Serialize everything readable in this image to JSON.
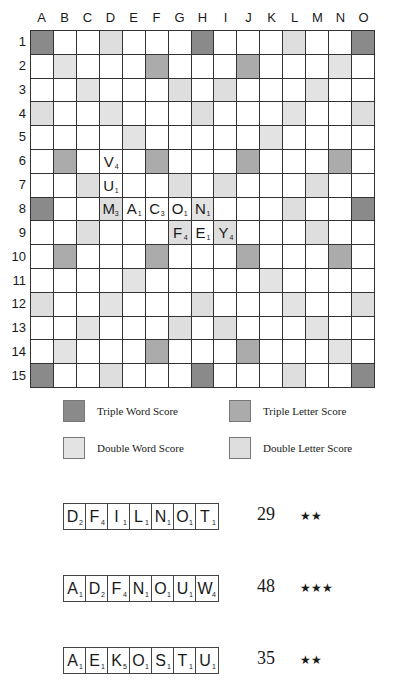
{
  "board": {
    "columns": [
      "A",
      "B",
      "C",
      "D",
      "E",
      "F",
      "G",
      "H",
      "I",
      "J",
      "K",
      "L",
      "M",
      "N",
      "O"
    ],
    "rows": [
      "1",
      "2",
      "3",
      "4",
      "5",
      "6",
      "7",
      "8",
      "9",
      "10",
      "11",
      "12",
      "13",
      "14",
      "15"
    ],
    "premium_layout": [
      "TW..DL...TW...DL..TW",
      "x"
    ],
    "premium_rows": [
      [
        "TW",
        "",
        "",
        "DL",
        "",
        "",
        "",
        "TW",
        "",
        "",
        "",
        "DL",
        "",
        "",
        "TW"
      ],
      [
        "",
        "DW",
        "",
        "",
        "",
        "TL",
        "",
        "",
        "",
        "TL",
        "",
        "",
        "",
        "DW",
        ""
      ],
      [
        "",
        "",
        "DW",
        "",
        "",
        "",
        "DL",
        "",
        "DL",
        "",
        "",
        "",
        "DW",
        "",
        ""
      ],
      [
        "DL",
        "",
        "",
        "DW",
        "",
        "",
        "",
        "DL",
        "",
        "",
        "",
        "DW",
        "",
        "",
        "DL"
      ],
      [
        "",
        "",
        "",
        "",
        "DW",
        "",
        "",
        "",
        "",
        "",
        "DW",
        "",
        "",
        "",
        ""
      ],
      [
        "",
        "TL",
        "",
        "",
        "",
        "TL",
        "",
        "",
        "",
        "TL",
        "",
        "",
        "",
        "TL",
        ""
      ],
      [
        "",
        "",
        "DL",
        "",
        "",
        "",
        "DL",
        "",
        "DL",
        "",
        "",
        "",
        "DL",
        "",
        ""
      ],
      [
        "TW",
        "",
        "",
        "DL",
        "",
        "",
        "",
        "DW",
        "",
        "",
        "",
        "DL",
        "",
        "",
        "TW"
      ],
      [
        "",
        "",
        "DL",
        "",
        "",
        "",
        "DL",
        "",
        "DL",
        "",
        "",
        "",
        "DL",
        "",
        ""
      ],
      [
        "",
        "TL",
        "",
        "",
        "",
        "TL",
        "",
        "",
        "",
        "TL",
        "",
        "",
        "",
        "TL",
        ""
      ],
      [
        "",
        "",
        "",
        "",
        "DW",
        "",
        "",
        "",
        "",
        "",
        "DW",
        "",
        "",
        "",
        ""
      ],
      [
        "DL",
        "",
        "",
        "DW",
        "",
        "",
        "",
        "DL",
        "",
        "",
        "",
        "DW",
        "",
        "",
        "DL"
      ],
      [
        "",
        "",
        "DW",
        "",
        "",
        "",
        "DL",
        "",
        "DL",
        "",
        "",
        "",
        "DW",
        "",
        ""
      ],
      [
        "",
        "DW",
        "",
        "",
        "",
        "TL",
        "",
        "",
        "",
        "TL",
        "",
        "",
        "",
        "DW",
        ""
      ],
      [
        "TW",
        "",
        "",
        "DL",
        "",
        "",
        "",
        "TW",
        "",
        "",
        "",
        "DL",
        "",
        "",
        "TW"
      ]
    ],
    "placed_tiles": [
      {
        "col": "D",
        "row": 6,
        "letter": "V",
        "score": "4"
      },
      {
        "col": "D",
        "row": 7,
        "letter": "U",
        "score": "1"
      },
      {
        "col": "D",
        "row": 8,
        "letter": "M",
        "score": "3"
      },
      {
        "col": "E",
        "row": 8,
        "letter": "A",
        "score": "1"
      },
      {
        "col": "F",
        "row": 8,
        "letter": "C",
        "score": "3"
      },
      {
        "col": "G",
        "row": 8,
        "letter": "O",
        "score": "1"
      },
      {
        "col": "H",
        "row": 8,
        "letter": "N",
        "score": "1"
      },
      {
        "col": "G",
        "row": 9,
        "letter": "F",
        "score": "4"
      },
      {
        "col": "H",
        "row": 9,
        "letter": "E",
        "score": "1"
      },
      {
        "col": "I",
        "row": 9,
        "letter": "Y",
        "score": "4"
      }
    ]
  },
  "legend": {
    "triple_word": "Triple Word Score",
    "triple_letter": "Triple Letter Score",
    "double_word": "Double Word Score",
    "double_letter": "Double Letter Score"
  },
  "colors": {
    "TW": "#8a8a8a",
    "TL": "#ababab",
    "DW": "#e3e3e3",
    "DL": "#dedede"
  },
  "racks": [
    {
      "tiles": [
        {
          "letter": "D",
          "score": "2"
        },
        {
          "letter": "F",
          "score": "4"
        },
        {
          "letter": "I",
          "score": "1"
        },
        {
          "letter": "L",
          "score": "1"
        },
        {
          "letter": "N",
          "score": "1"
        },
        {
          "letter": "O",
          "score": "1"
        },
        {
          "letter": "T",
          "score": "1"
        }
      ],
      "points": "29",
      "difficulty": "★★"
    },
    {
      "tiles": [
        {
          "letter": "A",
          "score": "1"
        },
        {
          "letter": "D",
          "score": "2"
        },
        {
          "letter": "F",
          "score": "4"
        },
        {
          "letter": "N",
          "score": "1"
        },
        {
          "letter": "O",
          "score": "1"
        },
        {
          "letter": "U",
          "score": "1"
        },
        {
          "letter": "W",
          "score": "4"
        }
      ],
      "points": "48",
      "difficulty": "★★★"
    },
    {
      "tiles": [
        {
          "letter": "A",
          "score": "1"
        },
        {
          "letter": "E",
          "score": "1"
        },
        {
          "letter": "K",
          "score": "5"
        },
        {
          "letter": "O",
          "score": "1"
        },
        {
          "letter": "S",
          "score": "1"
        },
        {
          "letter": "T",
          "score": "1"
        },
        {
          "letter": "U",
          "score": "1"
        }
      ],
      "points": "35",
      "difficulty": "★★"
    }
  ]
}
